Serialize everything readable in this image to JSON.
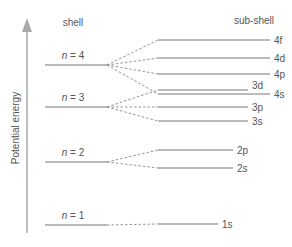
{
  "diagram": {
    "shell_heading": "shell",
    "subshell_heading": "sub-shell",
    "axis_label": "Potential energy",
    "colors": {
      "line": "#777777",
      "axis": "#aaaaaa",
      "text": "#555555"
    },
    "shells": [
      {
        "n_label": "n",
        "eq": " = 4",
        "y": 65
      },
      {
        "n_label": "n",
        "eq": " = 3",
        "y": 107
      },
      {
        "n_label": "n",
        "eq": " = 2",
        "y": 162
      },
      {
        "n_label": "n",
        "eq": " = 1",
        "y": 225
      }
    ],
    "subshells": [
      {
        "label": "4f",
        "y": 40,
        "x2": 270,
        "shell": 0
      },
      {
        "label": "4d",
        "y": 58,
        "x2": 270,
        "shell": 0
      },
      {
        "label": "4p",
        "y": 74,
        "x2": 270,
        "shell": 0
      },
      {
        "label": "3d",
        "y": 90,
        "x2": 248,
        "shell": 1
      },
      {
        "label": "4s",
        "y": 94,
        "x2": 270,
        "shell": 0
      },
      {
        "label": "3p",
        "y": 107,
        "x2": 248,
        "shell": 1
      },
      {
        "label": "3s",
        "y": 121,
        "x2": 248,
        "shell": 1
      },
      {
        "label": "2p",
        "y": 150,
        "x2": 233,
        "shell": 2
      },
      {
        "label": "2s",
        "y": 168,
        "x2": 233,
        "shell": 2
      },
      {
        "label": "1s",
        "y": 224,
        "x2": 218,
        "shell": 3
      }
    ]
  }
}
